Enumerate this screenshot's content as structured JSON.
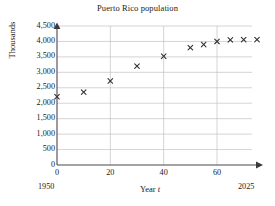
{
  "chart_data": {
    "type": "scatter",
    "title": "Puerto Rico population",
    "xlabel": "Year t",
    "ylabel": "Thousands",
    "xlim": [
      0,
      75
    ],
    "ylim": [
      0,
      4500
    ],
    "grid": true,
    "legend": false,
    "x_ticks": [
      "0",
      "20",
      "40",
      "60"
    ],
    "x_tick_values": [
      0,
      20,
      40,
      60
    ],
    "y_ticks": [
      "0",
      "500",
      "1,000",
      "1,500",
      "2,000",
      "2,500",
      "3,000",
      "3,500",
      "4,000",
      "4,500"
    ],
    "y_tick_values": [
      0,
      500,
      1000,
      1500,
      2000,
      2500,
      3000,
      3500,
      4000,
      4500
    ],
    "axis_start_label": "1950",
    "axis_end_label": "2025",
    "marker": "x",
    "marker_color": "#333333",
    "series": [
      {
        "name": "Puerto Rico population",
        "x": [
          0,
          10,
          20,
          30,
          40,
          50,
          55,
          60,
          65,
          70,
          75
        ],
        "values": [
          2210,
          2360,
          2720,
          3200,
          3520,
          3800,
          3900,
          4000,
          4050,
          4060,
          4060
        ]
      }
    ]
  },
  "colors": {
    "axis": "#4a4a4a",
    "grid": "#b8b8b8",
    "marker": "#333333",
    "text": "#1a1a1a",
    "background": "#ffffff"
  }
}
